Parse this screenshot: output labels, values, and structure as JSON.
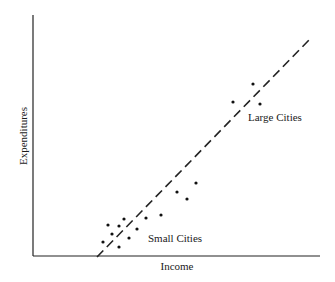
{
  "chart_data": {
    "type": "scatter",
    "title": "",
    "xlabel": "Income",
    "ylabel": "Expenditures",
    "grid": false,
    "legend": null,
    "axis_ticks": "none",
    "series": [
      {
        "name": "Small Cities",
        "points": [
          [
            103,
            242
          ],
          [
            108,
            225
          ],
          [
            112,
            234
          ],
          [
            119,
            226
          ],
          [
            124,
            219
          ],
          [
            119,
            247
          ],
          [
            129,
            238
          ],
          [
            137,
            229
          ],
          [
            146,
            218
          ],
          [
            161,
            215
          ],
          [
            177,
            192
          ],
          [
            187,
            199
          ],
          [
            196,
            183
          ]
        ]
      },
      {
        "name": "Large Cities",
        "points": [
          [
            233,
            102
          ],
          [
            253,
            84
          ],
          [
            260,
            104
          ]
        ]
      }
    ],
    "fit_line": {
      "style": "dashed",
      "from": [
        97,
        257
      ],
      "to": [
        310,
        39
      ]
    },
    "annotations": [
      {
        "text": "Small Cities",
        "x": 148,
        "y": 242
      },
      {
        "text": "Large Cities",
        "x": 248,
        "y": 121
      }
    ]
  },
  "labels": {
    "xlabel": "Income",
    "ylabel": "Expenditures",
    "small": "Small Cities",
    "large": "Large Cities"
  }
}
